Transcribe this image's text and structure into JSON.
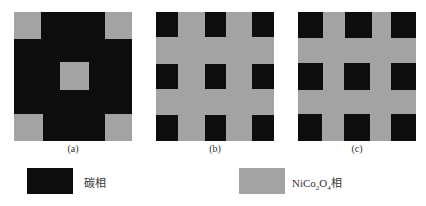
{
  "colors": {
    "carbon_phase": "#0d0d0d",
    "nico2o4_phase": "#a3a3a3",
    "background": "#ffffff"
  },
  "panels": [
    {
      "caption": "(a)",
      "background": "carbon",
      "inclusions": "NiCo2O4 corners + center"
    },
    {
      "caption": "(b)",
      "background": "NiCo2O4",
      "inclusions": "3x3 carbon squares"
    },
    {
      "caption": "(c)",
      "background": "NiCo2O4",
      "inclusions": "3x3 carbon squares"
    }
  ],
  "legend": {
    "carbon_label": "碳相",
    "nico2o4_label_prefix": "NiCo",
    "nico2o4_sub1": "2",
    "nico2o4_mid": "O",
    "nico2o4_sub2": "4",
    "nico2o4_suffix": "相"
  }
}
